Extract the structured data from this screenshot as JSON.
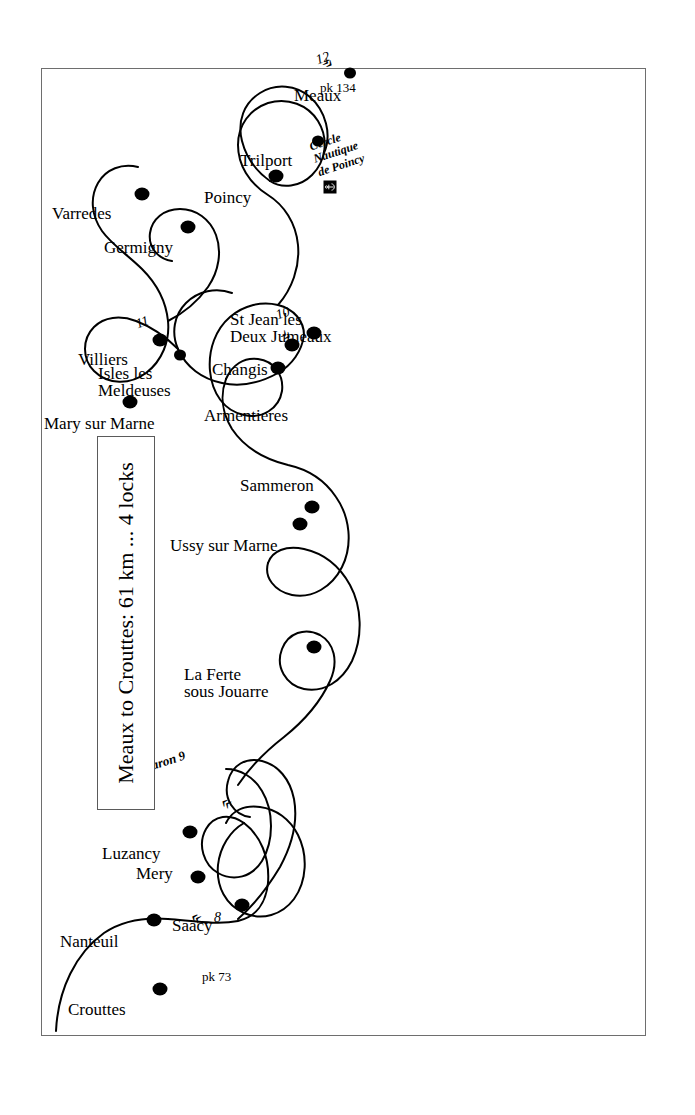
{
  "title": {
    "text": "Meaux to Crouttes: 61 km ... 4 locks"
  },
  "map": {
    "river_name": "Marne",
    "orientation_note": "rotated 90 degrees counter-clockwise"
  },
  "places": [
    {
      "name": "Crouttes",
      "dot_x": 48,
      "dot_y": 118,
      "lx": 34,
      "ly": 24,
      "lines": 1
    },
    {
      "name": "Nanteuil",
      "dot_x": 117,
      "dot_y": 112,
      "lx": 103,
      "ly": 16,
      "lines": 1
    },
    {
      "name": "Saacy",
      "dot_x": 132,
      "dot_y": 200,
      "lx": 118,
      "ly": 128,
      "lines": 1
    },
    {
      "name": "Mery",
      "dot_x": 160,
      "dot_y": 156,
      "lx": 172,
      "ly": 92,
      "lines": 1
    },
    {
      "name": "Luzancy",
      "dot_x": 205,
      "dot_y": 148,
      "lx": 193,
      "ly": 58,
      "lines": 1
    },
    {
      "name": "La Ferte\nsous Jouarre",
      "dot_x": 390,
      "dot_y": 272,
      "lx": 372,
      "ly": 140,
      "lines": 2
    },
    {
      "name": "Ussy sur Marne",
      "dot_x": 513,
      "dot_y": 258,
      "lx": 500,
      "ly": 128,
      "lines": 1
    },
    {
      "name": "Sammeron",
      "dot_x": 530,
      "dot_y": 270,
      "lx": 560,
      "ly": 196,
      "lines": 1
    },
    {
      "name": "Mary sur Marne",
      "dot_x": 635,
      "dot_y": 88,
      "lx": 622,
      "ly": 0,
      "lines": 1
    },
    {
      "name": "Isles les\nMeldeuses",
      "dot_x": 682,
      "dot_y": 138,
      "lx": 672,
      "ly": 54,
      "lines": 2
    },
    {
      "name": "Villiers",
      "dot_x": 697,
      "dot_y": 118,
      "lx": 685,
      "ly": 34,
      "lines": 1
    },
    {
      "name": "Armentieres",
      "dot_x": 669,
      "dot_y": 236,
      "lx": 631,
      "ly": 160,
      "lines": 1
    },
    {
      "name": "Changis",
      "dot_x": 692,
      "dot_y": 250,
      "lx": 676,
      "ly": 168,
      "lines": 1
    },
    {
      "name": "St Jean les\nDeux Jumeaux",
      "dot_x": 704,
      "dot_y": 272,
      "lx": 727,
      "ly": 186,
      "lines": 2
    },
    {
      "name": "Varredes",
      "dot_x": 843,
      "dot_y": 100,
      "lx": 831,
      "ly": 8,
      "lines": 1
    },
    {
      "name": "Germigny",
      "dot_x": 810,
      "dot_y": 146,
      "lx": 798,
      "ly": 60,
      "lines": 1
    },
    {
      "name": "Poincy",
      "dot_x": 861,
      "dot_y": 234,
      "lx": 848,
      "ly": 160,
      "lines": 1
    },
    {
      "name": "Trilport",
      "dot_x": 896,
      "dot_y": 276,
      "lx": 885,
      "ly": 196,
      "lines": 1
    },
    {
      "name": "Meaux",
      "dot_x": 964,
      "dot_y": 308,
      "lx": 950,
      "ly": 250,
      "lines": 1
    }
  ],
  "pk_markers": [
    {
      "label": "pk 73",
      "x": 67,
      "y": 160
    },
    {
      "label": "pk 134",
      "x": 956,
      "y": 276
    }
  ],
  "locks": [
    {
      "number": "8",
      "label": "8",
      "lx": 126,
      "ly": 170,
      "cx": 133,
      "cy": 155,
      "chevrons": "«"
    },
    {
      "number": "9",
      "label": "Courtaron 9",
      "lx": 265,
      "ly": 78,
      "cx": 246,
      "cy": 188,
      "chevrons": "«",
      "italic_name": true
    },
    {
      "number": "10",
      "label": "10",
      "lx": 726,
      "ly": 236,
      "cx": 714,
      "cy": 248,
      "chevrons": "»"
    },
    {
      "number": "11",
      "label": "11",
      "lx": 717,
      "ly": 94,
      "cx": 709,
      "cy": 122,
      "chevrons": "»"
    },
    {
      "number": "12",
      "label": "12",
      "lx": 981,
      "ly": 274,
      "cx": 990,
      "cy": 290,
      "chevrons": "»»"
    }
  ],
  "marina": {
    "label": "Cercle\nNautique\nde Poincy",
    "icon": "anchor-icon",
    "box_x": 850,
    "box_y": 288,
    "lx": 896,
    "ly": 268
  },
  "colors": {
    "ink": "#000000",
    "frame": "#6e6e6e",
    "paper": "#ffffff"
  },
  "river_path": "M 12,28 C 60,30 96,58 110,96 C 120,124 116,150 112,172 C 106,200 120,216 146,218 C 176,220 196,206 206,190 C 214,176 210,162 196,156 C 178,148 160,154 150,166 C 140,178 142,192 152,200 C 168,214 196,216 216,206 C 232,198 238,182 234,168 C 228,148 206,136 186,140 C 176,142 170,150 172,158 M 234,168 C 248,178 262,186 274,196 C 292,212 306,232 322,248 C 340,266 362,278 386,282 C 404,285 418,278 424,264 C 430,250 424,236 412,230 C 396,222 378,230 372,246 C 366,264 374,284 390,296 C 412,312 444,316 470,308 C 492,302 508,288 516,272 C 524,256 520,240 508,234 C 492,226 474,238 470,256 C 466,276 478,296 498,306 C 520,317 548,314 568,300 C 586,288 596,270 600,252 C 606,228 618,208 636,196 C 652,186 670,184 686,190 C 700,195 708,206 706,218 C 704,232 692,240 678,238 C 660,235 650,220 654,204 C 658,186 674,174 694,172 C 714,170 732,176 744,188 C 756,200 760,216 756,230 C 752,246 740,256 726,256",
  "river_path2": "M 706,122 C 722,128 742,128 760,120 C 780,111 794,96 800,80 C 806,62 800,46 786,40 C 770,33 752,42 746,60 C 740,80 750,100 768,110 C 788,121 814,120 834,110 C 850,102 862,90 872,78 C 884,63 898,52 916,48 C 934,44 950,50 958,64",
  "river_path3": "M 712,248 C 730,258 752,262 774,258 C 796,254 814,242 824,226 C 836,207 852,194 872,190 C 892,186 910,194 920,210 C 930,226 928,246 916,260 C 902,276 878,282 858,274 C 840,267 830,250 834,234"
}
